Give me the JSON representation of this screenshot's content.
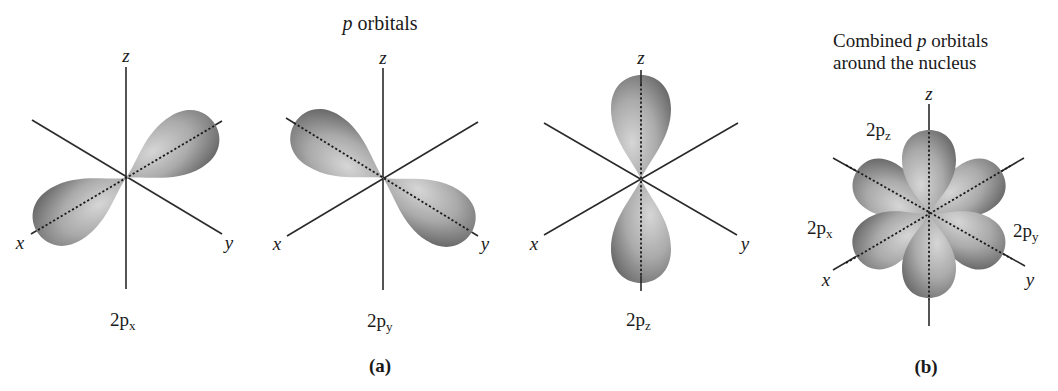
{
  "figure": {
    "panel_a": {
      "title_italic": "p",
      "title_rest": " orbitals",
      "caption": "(a)",
      "orbitals": [
        {
          "name": "2p",
          "subscript": "x",
          "axis_x": "x",
          "axis_y": "y",
          "axis_z": "z"
        },
        {
          "name": "2p",
          "subscript": "y",
          "axis_x": "x",
          "axis_y": "y",
          "axis_z": "z"
        },
        {
          "name": "2p",
          "subscript": "z",
          "axis_x": "x",
          "axis_y": "y",
          "axis_z": "z"
        }
      ]
    },
    "panel_b": {
      "title_line1_a": "Combined ",
      "title_line1_italic": "p",
      "title_line1_b": " orbitals",
      "title_line2": "around the nucleus",
      "caption": "(b)",
      "axis_x": "x",
      "axis_y": "y",
      "axis_z": "z",
      "lobe_labels": [
        {
          "name": "2p",
          "subscript": "z"
        },
        {
          "name": "2p",
          "subscript": "x"
        },
        {
          "name": "2p",
          "subscript": "y"
        }
      ]
    },
    "colors": {
      "lobe_light": "#d4d4d4",
      "lobe_mid": "#a8a8a8",
      "lobe_dark": "#6e6e6e",
      "axis": "#2a2a2a",
      "text": "#1a1a1a"
    }
  }
}
